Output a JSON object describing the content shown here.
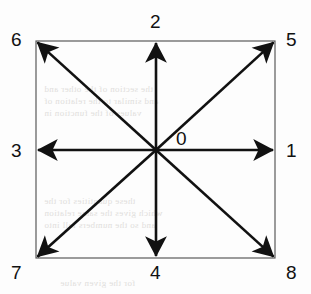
{
  "figure": {
    "background_color": "#fdfdfd",
    "stroke_color": "#111111",
    "box_border_color": "#555555",
    "origin_label": "0"
  },
  "box": {
    "left": 36,
    "top": 41,
    "right": 275,
    "bottom": 258
  },
  "origin": {
    "x": 156,
    "y": 150
  },
  "chart_data": {
    "type": "diagram",
    "origin_label": "0",
    "directions": [
      {
        "label": "1",
        "name": "east",
        "angle_deg": 0,
        "tip_x": 275,
        "tip_y": 150,
        "label_x": 286,
        "label_y": 141
      },
      {
        "label": "2",
        "name": "north",
        "angle_deg": 90,
        "tip_x": 156,
        "tip_y": 41,
        "label_x": 150,
        "label_y": 12
      },
      {
        "label": "3",
        "name": "west",
        "angle_deg": 180,
        "tip_x": 36,
        "tip_y": 150,
        "label_x": 11,
        "label_y": 141
      },
      {
        "label": "4",
        "name": "south",
        "angle_deg": 270,
        "tip_x": 156,
        "tip_y": 258,
        "label_x": 150,
        "label_y": 263
      },
      {
        "label": "5",
        "name": "north-east",
        "angle_deg": 45,
        "tip_x": 275,
        "tip_y": 41,
        "label_x": 286,
        "label_y": 30
      },
      {
        "label": "6",
        "name": "north-west",
        "angle_deg": 135,
        "tip_x": 36,
        "tip_y": 41,
        "label_x": 11,
        "label_y": 30
      },
      {
        "label": "7",
        "name": "south-west",
        "angle_deg": 225,
        "tip_x": 36,
        "tip_y": 258,
        "label_x": 11,
        "label_y": 263
      },
      {
        "label": "8",
        "name": "south-east",
        "angle_deg": 315,
        "tip_x": 275,
        "tip_y": 258,
        "label_x": 286,
        "label_y": 263
      }
    ]
  },
  "background_bleed": {
    "note": "faint mirrored show-through text from the reverse of the scanned page",
    "lines": [
      {
        "text": "the section of the other and",
        "x": 44,
        "y": 84
      },
      {
        "text": "and similar to the relation of",
        "x": 44,
        "y": 96
      },
      {
        "text": "values of the function in",
        "x": 44,
        "y": 108
      },
      {
        "text": "these quantities for the",
        "x": 44,
        "y": 196
      },
      {
        "text": "which gives the same relation",
        "x": 44,
        "y": 208
      },
      {
        "text": "and so the numbers fall into",
        "x": 44,
        "y": 220
      },
      {
        "text": "for the given value",
        "x": 60,
        "y": 278
      }
    ]
  }
}
